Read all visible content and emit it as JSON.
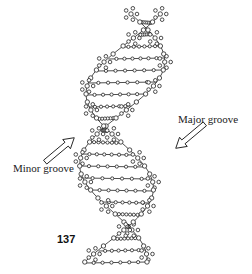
{
  "diagram": {
    "labels": {
      "major_groove": "Major groove",
      "minor_groove": "Minor groove"
    },
    "figure_number": "137"
  }
}
